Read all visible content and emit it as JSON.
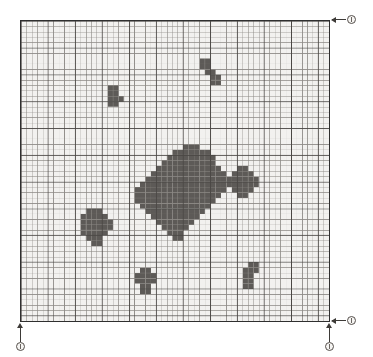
{
  "figure": {
    "kind": "raster-grid-map",
    "watermark_top": "",
    "watermark_bottom": ""
  },
  "colors": {
    "grid_background": "#f2f1ef",
    "grid_line": "#4a4744",
    "grid_line_minor": "#8d8a86",
    "cell_fill": "#5d5a57",
    "border": "#2f2f2f",
    "marker_stroke": "#55504c",
    "marker_fill": "#f6f5f3",
    "leader_line": "#3d3a37"
  },
  "grid": {
    "columns": 57,
    "rows": 56,
    "cell_size_px": 5.44,
    "origin_x_px": 20,
    "origin_y_px": 20,
    "width_px": 310,
    "height_px": 302,
    "major_every": 5,
    "show_border": true
  },
  "markers": [
    {
      "id": "marker-top-right",
      "label": "0",
      "anchor": "top-right-corner",
      "arrow": "left"
    },
    {
      "id": "marker-bottom-right",
      "label": "1",
      "anchor": "bottom-right-corner",
      "arrow": "left"
    },
    {
      "id": "marker-bottom-axis",
      "label": "1",
      "anchor": "bottom-right-corner",
      "arrow": "up"
    },
    {
      "id": "marker-bottom-left",
      "label": "0",
      "anchor": "bottom-left-corner",
      "arrow": "up"
    }
  ],
  "chart_data": {
    "type": "heatmap",
    "title": "",
    "xlabel": "",
    "ylabel": "",
    "grid": true,
    "legend": "none",
    "xlim": [
      0,
      57
    ],
    "ylim": [
      0,
      56
    ],
    "colorscale": [
      "#f2f1ef",
      "#5d5a57"
    ],
    "note": "Binary occupancy lattice: 1 = filled dark cell, 0 = empty. Cells listed as clusters of [col,row] pairs with col measured from left (0-based) and row from top (0-based).",
    "clusters": [
      {
        "name": "cluster-upper-right-small",
        "cells": [
          [
            33,
            7
          ],
          [
            34,
            7
          ],
          [
            33,
            8
          ],
          [
            34,
            8
          ],
          [
            34,
            9
          ],
          [
            35,
            9
          ],
          [
            35,
            10
          ],
          [
            36,
            10
          ],
          [
            35,
            11
          ],
          [
            36,
            11
          ]
        ]
      },
      {
        "name": "cluster-upper-left-small",
        "cells": [
          [
            16,
            12
          ],
          [
            17,
            12
          ],
          [
            16,
            13
          ],
          [
            17,
            13
          ],
          [
            16,
            14
          ],
          [
            17,
            14
          ],
          [
            18,
            14
          ],
          [
            16,
            15
          ],
          [
            17,
            15
          ]
        ]
      },
      {
        "name": "cluster-central-large",
        "cells": [
          [
            30,
            23
          ],
          [
            31,
            23
          ],
          [
            32,
            23
          ],
          [
            28,
            24
          ],
          [
            29,
            24
          ],
          [
            30,
            24
          ],
          [
            31,
            24
          ],
          [
            32,
            24
          ],
          [
            33,
            24
          ],
          [
            34,
            24
          ],
          [
            27,
            25
          ],
          [
            28,
            25
          ],
          [
            29,
            25
          ],
          [
            30,
            25
          ],
          [
            31,
            25
          ],
          [
            32,
            25
          ],
          [
            33,
            25
          ],
          [
            34,
            25
          ],
          [
            35,
            25
          ],
          [
            26,
            26
          ],
          [
            27,
            26
          ],
          [
            28,
            26
          ],
          [
            29,
            26
          ],
          [
            30,
            26
          ],
          [
            31,
            26
          ],
          [
            32,
            26
          ],
          [
            33,
            26
          ],
          [
            34,
            26
          ],
          [
            35,
            26
          ],
          [
            25,
            27
          ],
          [
            26,
            27
          ],
          [
            27,
            27
          ],
          [
            28,
            27
          ],
          [
            29,
            27
          ],
          [
            30,
            27
          ],
          [
            31,
            27
          ],
          [
            32,
            27
          ],
          [
            33,
            27
          ],
          [
            34,
            27
          ],
          [
            35,
            27
          ],
          [
            36,
            27
          ],
          [
            24,
            28
          ],
          [
            25,
            28
          ],
          [
            26,
            28
          ],
          [
            27,
            28
          ],
          [
            28,
            28
          ],
          [
            29,
            28
          ],
          [
            30,
            28
          ],
          [
            31,
            28
          ],
          [
            32,
            28
          ],
          [
            33,
            28
          ],
          [
            34,
            28
          ],
          [
            35,
            28
          ],
          [
            36,
            28
          ],
          [
            37,
            28
          ],
          [
            23,
            29
          ],
          [
            24,
            29
          ],
          [
            25,
            29
          ],
          [
            26,
            29
          ],
          [
            27,
            29
          ],
          [
            28,
            29
          ],
          [
            29,
            29
          ],
          [
            30,
            29
          ],
          [
            31,
            29
          ],
          [
            32,
            29
          ],
          [
            33,
            29
          ],
          [
            34,
            29
          ],
          [
            35,
            29
          ],
          [
            36,
            29
          ],
          [
            37,
            29
          ],
          [
            38,
            29
          ],
          [
            22,
            30
          ],
          [
            23,
            30
          ],
          [
            24,
            30
          ],
          [
            25,
            30
          ],
          [
            26,
            30
          ],
          [
            27,
            30
          ],
          [
            28,
            30
          ],
          [
            29,
            30
          ],
          [
            30,
            30
          ],
          [
            31,
            30
          ],
          [
            32,
            30
          ],
          [
            33,
            30
          ],
          [
            34,
            30
          ],
          [
            35,
            30
          ],
          [
            36,
            30
          ],
          [
            37,
            30
          ],
          [
            38,
            30
          ],
          [
            21,
            31
          ],
          [
            22,
            31
          ],
          [
            23,
            31
          ],
          [
            24,
            31
          ],
          [
            25,
            31
          ],
          [
            26,
            31
          ],
          [
            27,
            31
          ],
          [
            28,
            31
          ],
          [
            29,
            31
          ],
          [
            30,
            31
          ],
          [
            31,
            31
          ],
          [
            32,
            31
          ],
          [
            33,
            31
          ],
          [
            34,
            31
          ],
          [
            35,
            31
          ],
          [
            36,
            31
          ],
          [
            37,
            31
          ],
          [
            21,
            32
          ],
          [
            22,
            32
          ],
          [
            23,
            32
          ],
          [
            24,
            32
          ],
          [
            25,
            32
          ],
          [
            26,
            32
          ],
          [
            27,
            32
          ],
          [
            28,
            32
          ],
          [
            29,
            32
          ],
          [
            30,
            32
          ],
          [
            31,
            32
          ],
          [
            32,
            32
          ],
          [
            33,
            32
          ],
          [
            34,
            32
          ],
          [
            35,
            32
          ],
          [
            36,
            32
          ],
          [
            21,
            33
          ],
          [
            22,
            33
          ],
          [
            23,
            33
          ],
          [
            24,
            33
          ],
          [
            25,
            33
          ],
          [
            26,
            33
          ],
          [
            27,
            33
          ],
          [
            28,
            33
          ],
          [
            29,
            33
          ],
          [
            30,
            33
          ],
          [
            31,
            33
          ],
          [
            32,
            33
          ],
          [
            33,
            33
          ],
          [
            34,
            33
          ],
          [
            35,
            33
          ],
          [
            22,
            34
          ],
          [
            23,
            34
          ],
          [
            24,
            34
          ],
          [
            25,
            34
          ],
          [
            26,
            34
          ],
          [
            27,
            34
          ],
          [
            28,
            34
          ],
          [
            29,
            34
          ],
          [
            30,
            34
          ],
          [
            31,
            34
          ],
          [
            32,
            34
          ],
          [
            33,
            34
          ],
          [
            34,
            34
          ],
          [
            23,
            35
          ],
          [
            24,
            35
          ],
          [
            25,
            35
          ],
          [
            26,
            35
          ],
          [
            27,
            35
          ],
          [
            28,
            35
          ],
          [
            29,
            35
          ],
          [
            30,
            35
          ],
          [
            31,
            35
          ],
          [
            32,
            35
          ],
          [
            33,
            35
          ],
          [
            24,
            36
          ],
          [
            25,
            36
          ],
          [
            26,
            36
          ],
          [
            27,
            36
          ],
          [
            28,
            36
          ],
          [
            29,
            36
          ],
          [
            30,
            36
          ],
          [
            31,
            36
          ],
          [
            32,
            36
          ],
          [
            25,
            37
          ],
          [
            26,
            37
          ],
          [
            27,
            37
          ],
          [
            28,
            37
          ],
          [
            29,
            37
          ],
          [
            30,
            37
          ],
          [
            31,
            37
          ],
          [
            26,
            38
          ],
          [
            27,
            38
          ],
          [
            28,
            38
          ],
          [
            29,
            38
          ],
          [
            30,
            38
          ],
          [
            27,
            39
          ],
          [
            28,
            39
          ],
          [
            29,
            39
          ],
          [
            28,
            40
          ],
          [
            29,
            40
          ]
        ]
      },
      {
        "name": "cluster-right-appendage",
        "cells": [
          [
            40,
            27
          ],
          [
            41,
            27
          ],
          [
            39,
            28
          ],
          [
            40,
            28
          ],
          [
            41,
            28
          ],
          [
            42,
            28
          ],
          [
            39,
            29
          ],
          [
            40,
            29
          ],
          [
            41,
            29
          ],
          [
            42,
            29
          ],
          [
            43,
            29
          ],
          [
            38,
            30
          ],
          [
            39,
            30
          ],
          [
            40,
            30
          ],
          [
            41,
            30
          ],
          [
            42,
            30
          ],
          [
            43,
            30
          ],
          [
            39,
            31
          ],
          [
            40,
            31
          ],
          [
            41,
            31
          ],
          [
            42,
            31
          ],
          [
            40,
            32
          ],
          [
            41,
            32
          ]
        ]
      },
      {
        "name": "cluster-left-mid",
        "cells": [
          [
            12,
            35
          ],
          [
            13,
            35
          ],
          [
            14,
            35
          ],
          [
            11,
            36
          ],
          [
            12,
            36
          ],
          [
            13,
            36
          ],
          [
            14,
            36
          ],
          [
            15,
            36
          ],
          [
            11,
            37
          ],
          [
            12,
            37
          ],
          [
            13,
            37
          ],
          [
            14,
            37
          ],
          [
            15,
            37
          ],
          [
            16,
            37
          ],
          [
            11,
            38
          ],
          [
            12,
            38
          ],
          [
            13,
            38
          ],
          [
            14,
            38
          ],
          [
            15,
            38
          ],
          [
            16,
            38
          ],
          [
            11,
            39
          ],
          [
            12,
            39
          ],
          [
            13,
            39
          ],
          [
            14,
            39
          ],
          [
            15,
            39
          ],
          [
            12,
            40
          ],
          [
            13,
            40
          ],
          [
            14,
            40
          ],
          [
            13,
            41
          ],
          [
            14,
            41
          ]
        ]
      },
      {
        "name": "cluster-lower-left-small",
        "cells": [
          [
            22,
            46
          ],
          [
            23,
            46
          ],
          [
            21,
            47
          ],
          [
            22,
            47
          ],
          [
            23,
            47
          ],
          [
            24,
            47
          ],
          [
            21,
            48
          ],
          [
            22,
            48
          ],
          [
            23,
            48
          ],
          [
            24,
            48
          ],
          [
            22,
            49
          ],
          [
            23,
            49
          ],
          [
            22,
            50
          ],
          [
            23,
            50
          ]
        ]
      },
      {
        "name": "cluster-lower-right-small",
        "cells": [
          [
            42,
            45
          ],
          [
            43,
            45
          ],
          [
            41,
            46
          ],
          [
            42,
            46
          ],
          [
            43,
            46
          ],
          [
            41,
            47
          ],
          [
            42,
            47
          ],
          [
            41,
            48
          ],
          [
            42,
            48
          ],
          [
            41,
            49
          ],
          [
            42,
            49
          ]
        ]
      }
    ]
  }
}
